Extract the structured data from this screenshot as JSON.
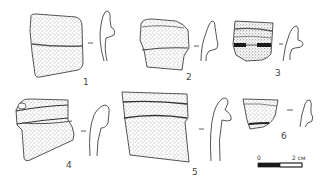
{
  "figure": {
    "type": "archaeological pottery plate",
    "background": "#ffffff",
    "ink_color": "#2a2a2a",
    "sherds": [
      {
        "id": 1,
        "label": "1"
      },
      {
        "id": 2,
        "label": "2"
      },
      {
        "id": 3,
        "label": "3"
      },
      {
        "id": 4,
        "label": "4"
      },
      {
        "id": 5,
        "label": "5"
      },
      {
        "id": 6,
        "label": "6"
      }
    ],
    "scale_bar": {
      "start_label": "0",
      "end_label": "2 см"
    }
  }
}
